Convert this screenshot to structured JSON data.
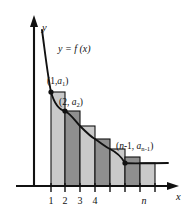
{
  "figure": {
    "axes": {
      "y_label": "y",
      "x_label": "x",
      "origin_px": [
        34,
        186
      ],
      "x_axis_end_px": [
        178,
        186
      ],
      "y_axis_top_px": [
        34,
        20
      ]
    },
    "curve": {
      "label": "y = f (x)",
      "label_pos_px": [
        58,
        49
      ],
      "description": "decreasing convex curve y = f(x)"
    },
    "x_ticks": [
      {
        "label": "1",
        "x_px": 51,
        "italic": false
      },
      {
        "label": "2",
        "x_px": 65,
        "italic": false
      },
      {
        "label": "3",
        "x_px": 80,
        "italic": false
      },
      {
        "label": "4",
        "x_px": 95,
        "italic": false
      },
      {
        "label": "n",
        "x_px": 144,
        "italic": true
      }
    ],
    "untitled_ticks_px": [
      110,
      125,
      144
    ],
    "point_labels": [
      {
        "id": "point-1",
        "text_main": "(1,",
        "text_italic": "a",
        "text_sub": "1",
        "text_close": ")",
        "full": "(1, a1)",
        "label_pos_px": [
          48,
          84
        ],
        "dot_px": [
          51,
          92
        ]
      },
      {
        "id": "point-2",
        "text_main": "(2, ",
        "text_italic": "a",
        "text_sub": "2",
        "text_close": ")",
        "full": "(2, a2)",
        "label_pos_px": [
          60,
          104
        ],
        "dot_px": [
          65,
          111
        ]
      },
      {
        "id": "point-n-minus-1",
        "text_main": "(",
        "text_italic_n": "n",
        "text_mid": "-1, ",
        "text_italic": "a",
        "text_sub": "n-1",
        "text_close": ")",
        "full": "(n-1, a n-1)",
        "label_pos_px": [
          117,
          148
        ],
        "dot_px": [
          125,
          163
        ]
      }
    ],
    "bars": [
      {
        "index": 1,
        "x_px": 51,
        "width_px": 14,
        "top_px": 92,
        "shade": "light"
      },
      {
        "index": 2,
        "x_px": 65,
        "width_px": 15,
        "top_px": 111,
        "shade": "dark"
      },
      {
        "index": 3,
        "x_px": 80,
        "width_px": 15,
        "top_px": 126,
        "shade": "light"
      },
      {
        "index": 4,
        "x_px": 95,
        "width_px": 15,
        "top_px": 139,
        "shade": "dark"
      },
      {
        "index": 5,
        "x_px": 110,
        "width_px": 15,
        "top_px": 149,
        "shade": "light"
      },
      {
        "index": 6,
        "x_px": 125,
        "width_px": 15,
        "top_px": 157,
        "shade": "dark"
      },
      {
        "index": 7,
        "x_px": 140,
        "width_px": 15,
        "top_px": 163,
        "shade": "light"
      }
    ],
    "colors": {
      "stroke": "#111111",
      "bar_light": "#c9c9c9",
      "bar_dark": "#8f8f8f",
      "background": "#ffffff"
    }
  }
}
